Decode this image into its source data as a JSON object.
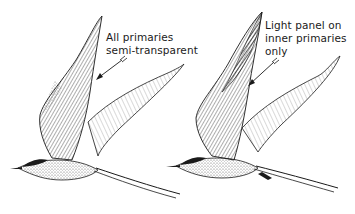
{
  "figure": {
    "birds": [
      {
        "id": "left-tern",
        "caption_lines": [
          "All primaries",
          "semi-transparent"
        ]
      },
      {
        "id": "right-tern",
        "caption_lines": [
          "Light panel on",
          "inner primaries",
          "only"
        ]
      }
    ],
    "colors": {
      "ink": "#1a1a1a",
      "background": "#ffffff"
    }
  }
}
